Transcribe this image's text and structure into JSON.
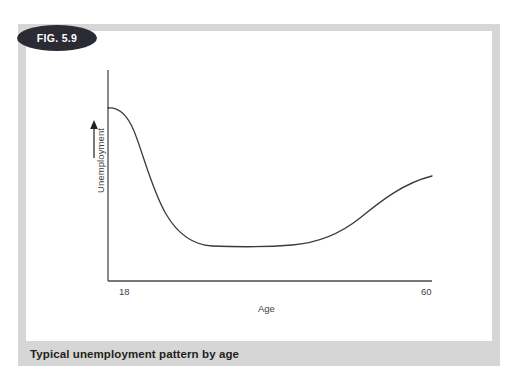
{
  "figure": {
    "badge_label": "FIG. 5.9",
    "caption": "Typical unemployment pattern by age",
    "badge_color": "#2b2b35",
    "frame_color": "#d6d6d6",
    "panel_color": "#ffffff",
    "caption_color": "#231f20"
  },
  "chart_data": {
    "type": "line",
    "title": "Typical unemployment pattern by age",
    "xlabel": "Age",
    "ylabel": "Unemployment",
    "grid": false,
    "legend": null,
    "xtick_labels": [
      "18",
      "60"
    ],
    "ytick_labels": [],
    "xlim": [
      18,
      60
    ],
    "ylim": [
      0,
      100
    ],
    "axis_note": "Y axis has an upward arrow indicating increasing unemployment; no numeric y ticks.",
    "series": [
      {
        "name": "Unemployment rate",
        "x": [
          18,
          20,
          22,
          24,
          26,
          28,
          30,
          34,
          38,
          42,
          46,
          50,
          54,
          57,
          60
        ],
        "values": [
          82,
          78,
          62,
          42,
          30,
          24,
          21,
          19,
          19,
          20,
          24,
          33,
          45,
          53,
          57
        ]
      }
    ],
    "curve_path": "M108,108 C119,107 127,114 134,131 C143,153 152,190 166,214 C180,238 196,245 212,246 C236,247 268,247 292,245 C318,243 340,234 360,218 C382,200 404,183 432,176"
  }
}
